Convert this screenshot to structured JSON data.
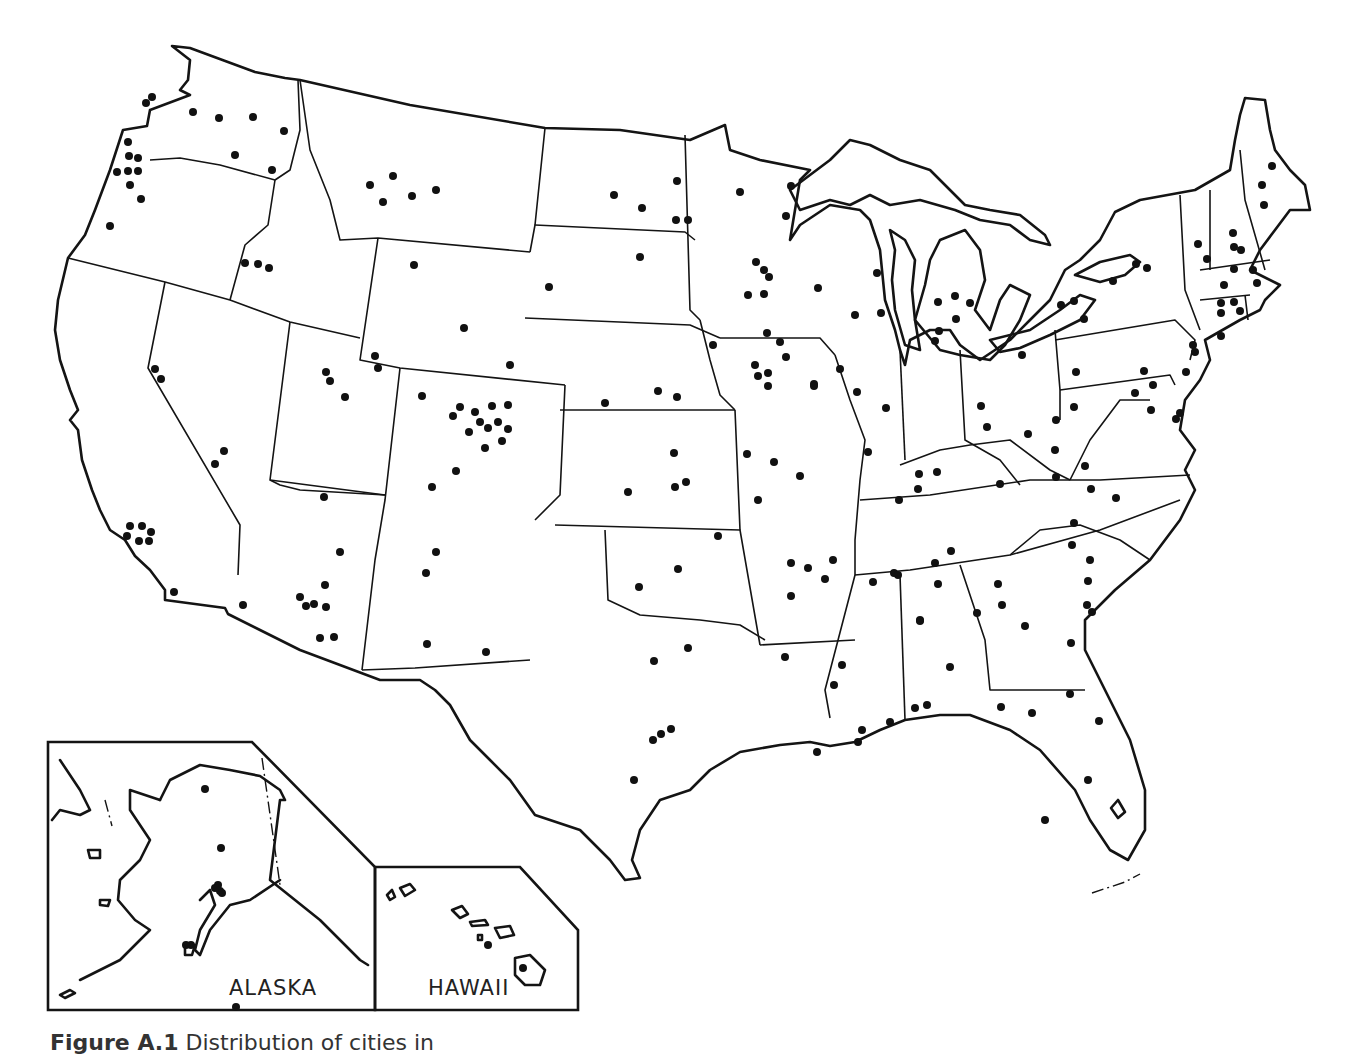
{
  "figure": {
    "caption_label": "Figure A.1",
    "caption_text": "Distribution of cities in"
  },
  "insets": {
    "alaska_label": "ALASKA",
    "hawaii_label": "HAWAII"
  },
  "colors": {
    "ink": "#141414",
    "background": "#ffffff"
  },
  "map_data": {
    "type": "dot-distribution",
    "region": "United States (contiguous) with Alaska and Hawaii insets",
    "dot_count_approx": 205,
    "dots": [
      [
        146,
        103
      ],
      [
        152,
        97
      ],
      [
        193,
        112
      ],
      [
        219,
        118
      ],
      [
        253,
        117
      ],
      [
        235,
        155
      ],
      [
        284,
        131
      ],
      [
        272,
        170
      ],
      [
        128,
        142
      ],
      [
        129,
        156
      ],
      [
        138,
        158
      ],
      [
        117,
        172
      ],
      [
        128,
        171
      ],
      [
        138,
        171
      ],
      [
        130,
        185
      ],
      [
        141,
        199
      ],
      [
        110,
        226
      ],
      [
        370,
        185
      ],
      [
        393,
        176
      ],
      [
        383,
        202
      ],
      [
        412,
        196
      ],
      [
        436,
        190
      ],
      [
        245,
        263
      ],
      [
        258,
        264
      ],
      [
        269,
        268
      ],
      [
        614,
        195
      ],
      [
        642,
        208
      ],
      [
        676,
        220
      ],
      [
        688,
        220
      ],
      [
        677,
        181
      ],
      [
        740,
        192
      ],
      [
        791,
        186
      ],
      [
        786,
        216
      ],
      [
        756,
        262
      ],
      [
        764,
        270
      ],
      [
        769,
        277
      ],
      [
        748,
        295
      ],
      [
        764,
        294
      ],
      [
        414,
        265
      ],
      [
        464,
        328
      ],
      [
        549,
        287
      ],
      [
        640,
        257
      ],
      [
        510,
        365
      ],
      [
        818,
        288
      ],
      [
        877,
        273
      ],
      [
        855,
        315
      ],
      [
        881,
        313
      ],
      [
        938,
        302
      ],
      [
        955,
        296
      ],
      [
        970,
        303
      ],
      [
        956,
        319
      ],
      [
        939,
        331
      ],
      [
        935,
        341
      ],
      [
        155,
        369
      ],
      [
        161,
        379
      ],
      [
        224,
        451
      ],
      [
        215,
        464
      ],
      [
        326,
        372
      ],
      [
        330,
        381
      ],
      [
        375,
        356
      ],
      [
        378,
        368
      ],
      [
        345,
        397
      ],
      [
        422,
        396
      ],
      [
        460,
        407
      ],
      [
        475,
        412
      ],
      [
        453,
        416
      ],
      [
        492,
        406
      ],
      [
        508,
        405
      ],
      [
        480,
        422
      ],
      [
        469,
        432
      ],
      [
        488,
        428
      ],
      [
        498,
        422
      ],
      [
        508,
        429
      ],
      [
        502,
        441
      ],
      [
        485,
        448
      ],
      [
        456,
        471
      ],
      [
        432,
        487
      ],
      [
        605,
        403
      ],
      [
        658,
        391
      ],
      [
        677,
        397
      ],
      [
        713,
        345
      ],
      [
        767,
        333
      ],
      [
        780,
        342
      ],
      [
        786,
        357
      ],
      [
        755,
        365
      ],
      [
        758,
        376
      ],
      [
        768,
        373
      ],
      [
        768,
        386
      ],
      [
        814,
        384
      ],
      [
        814,
        386
      ],
      [
        674,
        453
      ],
      [
        686,
        482
      ],
      [
        675,
        487
      ],
      [
        628,
        492
      ],
      [
        747,
        454
      ],
      [
        774,
        462
      ],
      [
        800,
        476
      ],
      [
        758,
        500
      ],
      [
        840,
        369
      ],
      [
        857,
        392
      ],
      [
        886,
        408
      ],
      [
        868,
        452
      ],
      [
        918,
        489
      ],
      [
        937,
        472
      ],
      [
        981,
        406
      ],
      [
        987,
        427
      ],
      [
        1028,
        434
      ],
      [
        1022,
        355
      ],
      [
        1076,
        372
      ],
      [
        1074,
        407
      ],
      [
        1056,
        420
      ],
      [
        1055,
        450
      ],
      [
        1056,
        477
      ],
      [
        1085,
        466
      ],
      [
        1091,
        489
      ],
      [
        1144,
        371
      ],
      [
        1135,
        393
      ],
      [
        1176,
        419
      ],
      [
        1151,
        410
      ],
      [
        1180,
        413
      ],
      [
        1147,
        268
      ],
      [
        1136,
        264
      ],
      [
        1113,
        281
      ],
      [
        1074,
        301
      ],
      [
        1084,
        319
      ],
      [
        1061,
        305
      ],
      [
        1198,
        244
      ],
      [
        1207,
        259
      ],
      [
        1233,
        233
      ],
      [
        1234,
        247
      ],
      [
        1241,
        250
      ],
      [
        1234,
        269
      ],
      [
        1224,
        285
      ],
      [
        1253,
        270
      ],
      [
        1257,
        283
      ],
      [
        1221,
        303
      ],
      [
        1221,
        313
      ],
      [
        1234,
        302
      ],
      [
        1221,
        336
      ],
      [
        1240,
        311
      ],
      [
        1272,
        166
      ],
      [
        1262,
        185
      ],
      [
        1264,
        205
      ],
      [
        1193,
        345
      ],
      [
        1195,
        352
      ],
      [
        1186,
        372
      ],
      [
        1153,
        385
      ],
      [
        1116,
        498
      ],
      [
        1072,
        545
      ],
      [
        1090,
        560
      ],
      [
        1087,
        605
      ],
      [
        1092,
        612
      ],
      [
        1070,
        694
      ],
      [
        1099,
        721
      ],
      [
        1088,
        780
      ],
      [
        1045,
        820
      ],
      [
        977,
        613
      ],
      [
        1002,
        605
      ],
      [
        1025,
        626
      ],
      [
        1071,
        643
      ],
      [
        899,
        500
      ],
      [
        919,
        474
      ],
      [
        1000,
        484
      ],
      [
        1074,
        523
      ],
      [
        1088,
        581
      ],
      [
        951,
        551
      ],
      [
        935,
        563
      ],
      [
        833,
        560
      ],
      [
        873,
        582
      ],
      [
        894,
        573
      ],
      [
        898,
        575
      ],
      [
        1001,
        707
      ],
      [
        1032,
        713
      ],
      [
        927,
        705
      ],
      [
        915,
        708
      ],
      [
        890,
        722
      ],
      [
        862,
        730
      ],
      [
        858,
        742
      ],
      [
        817,
        752
      ],
      [
        785,
        657
      ],
      [
        842,
        665
      ],
      [
        834,
        685
      ],
      [
        920,
        620
      ],
      [
        950,
        667
      ],
      [
        791,
        563
      ],
      [
        825,
        579
      ],
      [
        791,
        596
      ],
      [
        808,
        568
      ],
      [
        938,
        584
      ],
      [
        998,
        584
      ],
      [
        920,
        621
      ],
      [
        718,
        536
      ],
      [
        678,
        569
      ],
      [
        639,
        587
      ],
      [
        688,
        648
      ],
      [
        654,
        661
      ],
      [
        653,
        740
      ],
      [
        661,
        734
      ],
      [
        671,
        729
      ],
      [
        634,
        780
      ],
      [
        324,
        497
      ],
      [
        340,
        552
      ],
      [
        325,
        585
      ],
      [
        300,
        597
      ],
      [
        306,
        606
      ],
      [
        314,
        604
      ],
      [
        326,
        607
      ],
      [
        243,
        605
      ],
      [
        320,
        638
      ],
      [
        334,
        637
      ],
      [
        436,
        552
      ],
      [
        426,
        573
      ],
      [
        427,
        644
      ],
      [
        486,
        652
      ],
      [
        130,
        526
      ],
      [
        142,
        526
      ],
      [
        151,
        532
      ],
      [
        127,
        536
      ],
      [
        139,
        541
      ],
      [
        149,
        541
      ],
      [
        174,
        592
      ],
      [
        236,
        1007
      ],
      [
        205,
        789
      ],
      [
        218,
        885
      ],
      [
        220,
        891
      ],
      [
        191,
        945
      ]
    ],
    "alaska_dots": [
      [
        221,
        848
      ],
      [
        215,
        888
      ],
      [
        222,
        893
      ],
      [
        186,
        945
      ]
    ],
    "hawaii_dots": [
      [
        488,
        945
      ],
      [
        523,
        968
      ]
    ]
  }
}
